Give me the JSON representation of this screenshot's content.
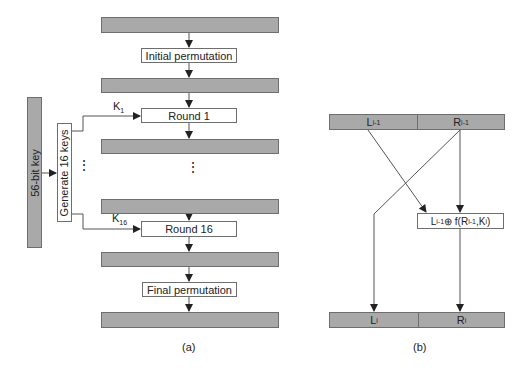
{
  "panel_a": {
    "caption": "(a)",
    "key_bar_label": "56-bit key",
    "generate_label": "Generate 16 keys",
    "key_labels": [
      {
        "base": "K",
        "sub": "1"
      },
      {
        "base": "K",
        "sub": "16"
      }
    ],
    "boxes": {
      "initial_permutation": "Initial permutation",
      "round_1": "Round 1",
      "round_16": "Round 16",
      "final_permutation": "Final permutation"
    },
    "ellipsis": "⋮"
  },
  "panel_b": {
    "caption": "(b)",
    "top_left": {
      "base": "L",
      "sub": "i-1"
    },
    "top_right": {
      "base": "R",
      "sub": "i-1"
    },
    "function_box": {
      "l": "L",
      "l_sub": "i-1",
      "op": " ⊕ f(R",
      "r_sub": "i-1",
      "mid": ",K",
      "k_sub": "i",
      "end": " )"
    },
    "bottom_left": {
      "base": "L",
      "sub": "i"
    },
    "bottom_right": {
      "base": "R",
      "sub": "i"
    }
  },
  "colors": {
    "bar_fill": "#a9a9a9",
    "line": "#555555"
  }
}
